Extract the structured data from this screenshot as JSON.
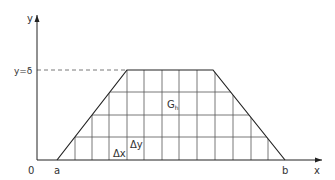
{
  "diagram": {
    "type": "trapezoid-grid-region",
    "axes": {
      "x_label": "x",
      "y_label": "y",
      "origin_label": "0"
    },
    "labels": {
      "a": "a",
      "b": "b",
      "y_level": "y=δ",
      "region": "G",
      "region_sub": "h",
      "dx": "Δx",
      "dy": "Δy"
    },
    "colors": {
      "stroke": "#333333",
      "grid": "#555555",
      "background": "#ffffff"
    }
  }
}
